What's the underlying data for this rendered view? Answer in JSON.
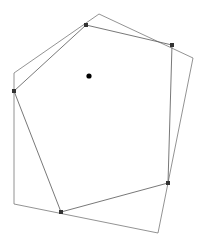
{
  "figure": {
    "background_color": "#ffffff",
    "width": 204,
    "height": 244
  },
  "chart_data": {
    "type": "scatter",
    "title": "",
    "xlabel": "",
    "ylabel": "",
    "xlim": [
      0,
      204
    ],
    "ylim": [
      0,
      244
    ],
    "grid": false,
    "legend": "none",
    "series": [
      {
        "name": "inner-polygon",
        "kind": "polygon",
        "closed": true,
        "stroke": "#555555",
        "stroke_width": 0.8,
        "fill": "none",
        "vertex_marker": "square",
        "vertex_color": "#333333",
        "points": [
          [
            14,
            91
          ],
          [
            86,
            25
          ],
          [
            172,
            45
          ],
          [
            168,
            183
          ],
          [
            61,
            212
          ]
        ]
      },
      {
        "name": "outer-polygon",
        "kind": "polygon",
        "closed": true,
        "stroke": "#777777",
        "stroke_width": 0.8,
        "fill": "none",
        "vertex_marker": "none",
        "points": [
          [
            14,
            73
          ],
          [
            99,
            14
          ],
          [
            193,
            58
          ],
          [
            158,
            233
          ],
          [
            14,
            204
          ]
        ]
      },
      {
        "name": "centroid-point",
        "kind": "point",
        "marker": "circle",
        "color": "#000000",
        "radius": 2.6,
        "points": [
          [
            89,
            76
          ]
        ]
      }
    ]
  }
}
